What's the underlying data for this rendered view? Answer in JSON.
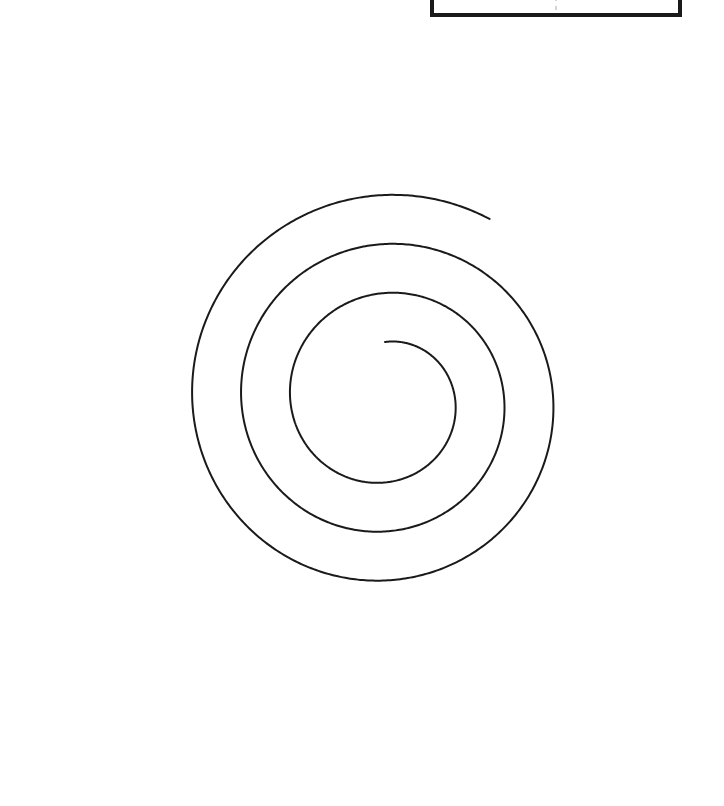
{
  "page": {
    "background_color": "#ffffff",
    "width": 724,
    "height": 806
  },
  "figure": {
    "name": "archimedean-spiral",
    "stroke_color": "#1a1a1a",
    "stroke_width": 2,
    "fill": "none",
    "center_x": 385,
    "center_y": 400,
    "turns": 3,
    "inner_radius": 58,
    "outer_radius": 366,
    "start_angle_deg": -90,
    "inner_endpoint": [
      390,
      341
    ],
    "outer_endpoint": [
      692,
      455
    ],
    "ring_extents": {
      "inner_left_x": 251,
      "inner_right_x": 480,
      "inner_top_y": 266,
      "inner_bottom_y": 462,
      "middle_left_x": 135,
      "middle_right_x": 583,
      "middle_top_y": 150,
      "middle_bottom_y": 560,
      "outer_left_x": 20,
      "outer_right_x": 700,
      "outer_top_y": 38,
      "outer_bottom_y": 782
    }
  },
  "top_panel": {
    "name": "top-right-panel",
    "left": 430,
    "right": 682,
    "bottom": 17,
    "border_color": "#1a1a1a",
    "border_width": 4,
    "divider_x": 556,
    "divider_color": "#b9b9b9",
    "divider_style": "dashed"
  },
  "chart_data": {
    "type": "line",
    "xlabel": "",
    "ylabel": "",
    "legend": [],
    "grid": false,
    "xlim": [
      0,
      724
    ],
    "ylim": [
      806,
      0
    ],
    "annotations": [],
    "series": [
      {
        "name": "spiral",
        "equation": "r = a + b * theta",
        "a": 58,
        "b": 49,
        "theta_start_deg": 0,
        "theta_end_deg": 1110,
        "center": [
          385,
          400
        ],
        "phase_deg": -90,
        "points": [
          [
            390,
            341
          ],
          [
            440,
            348
          ],
          [
            476,
            386
          ],
          [
            480,
            421
          ],
          [
            461,
            451
          ],
          [
            423,
            462
          ],
          [
            385,
            462
          ],
          [
            340,
            454
          ],
          [
            299,
            429
          ],
          [
            271,
            392
          ],
          [
            258,
            349
          ],
          [
            259,
            312
          ],
          [
            279,
            265
          ],
          [
            311,
            228
          ],
          [
            354,
            200
          ],
          [
            404,
            185
          ],
          [
            455,
            184
          ],
          [
            504,
            197
          ],
          [
            546,
            223
          ],
          [
            572,
            257
          ],
          [
            583,
            299
          ],
          [
            583,
            346
          ],
          [
            573,
            400
          ],
          [
            552,
            449
          ],
          [
            519,
            491
          ],
          [
            477,
            525
          ],
          [
            427,
            548
          ],
          [
            377,
            559
          ],
          [
            323,
            558
          ],
          [
            271,
            544
          ],
          [
            226,
            519
          ],
          [
            188,
            485
          ],
          [
            160,
            443
          ],
          [
            142,
            394
          ],
          [
            135,
            342
          ],
          [
            138,
            287
          ],
          [
            152,
            235
          ],
          [
            177,
            187
          ],
          [
            212,
            145
          ],
          [
            255,
            110
          ],
          [
            305,
            80
          ],
          [
            360,
            58
          ],
          [
            418,
            43
          ],
          [
            478,
            38
          ],
          [
            537,
            46
          ],
          [
            592,
            69
          ],
          [
            639,
            103
          ],
          [
            673,
            147
          ],
          [
            694,
            198
          ],
          [
            700,
            253
          ],
          [
            696,
            313
          ],
          [
            692,
            455
          ]
        ]
      },
      {
        "name": "spiral-outer-tail",
        "points": [
          [
            700,
            253
          ],
          [
            699,
            330
          ],
          [
            689,
            408
          ],
          [
            671,
            486
          ],
          [
            644,
            560
          ],
          [
            608,
            630
          ],
          [
            563,
            691
          ],
          [
            510,
            740
          ],
          [
            451,
            770
          ],
          [
            388,
            782
          ],
          [
            325,
            776
          ],
          [
            266,
            752
          ],
          [
            214,
            713
          ],
          [
            172,
            661
          ],
          [
            141,
            599
          ],
          [
            122,
            531
          ],
          [
            117,
            459
          ],
          [
            120,
            400
          ]
        ]
      }
    ]
  }
}
